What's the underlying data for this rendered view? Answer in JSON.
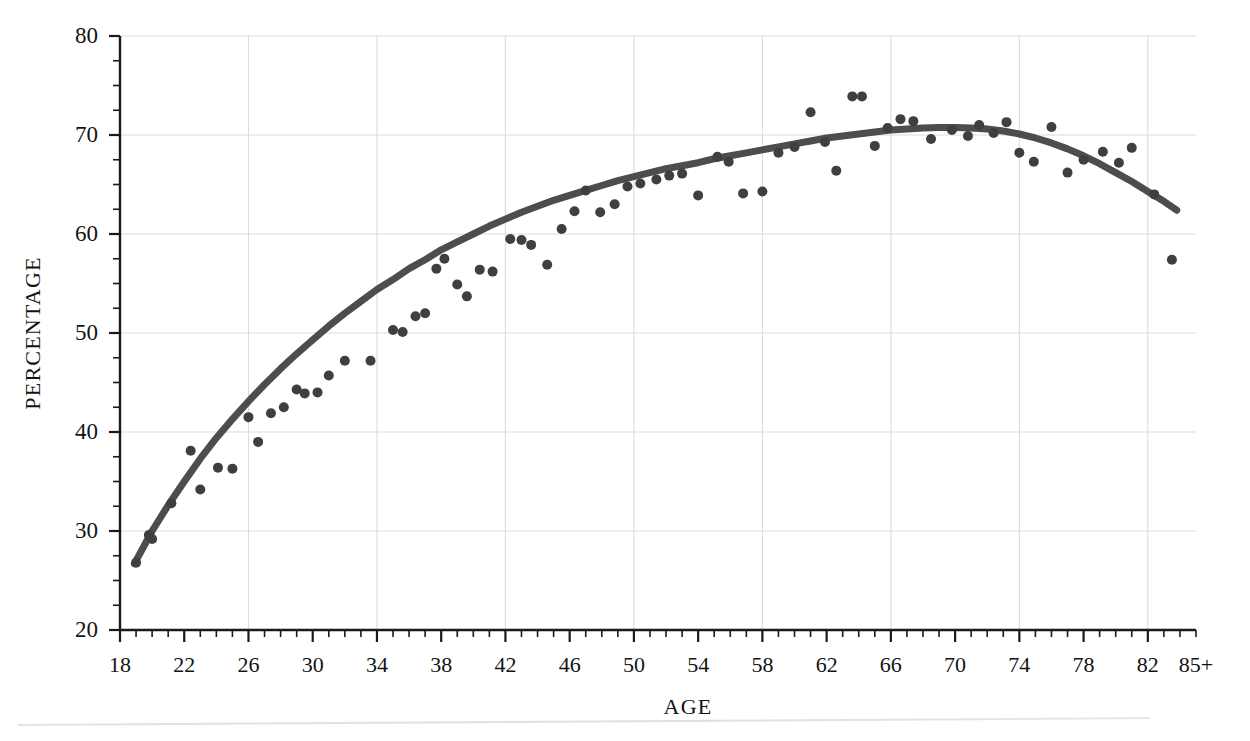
{
  "figure": {
    "top_cropped_text": "",
    "background_color": "#ffffff",
    "curve_color": "#4d4d4d",
    "point_color": "#3f3f3f",
    "grid_color": "#dcdcdc",
    "axis_color": "#1a1a1a"
  },
  "chart_data": {
    "type": "scatter",
    "title": "",
    "xlabel": "AGE",
    "ylabel": "PERCENTAGE",
    "xlim": [
      18,
      85
    ],
    "ylim": [
      20,
      80
    ],
    "grid": true,
    "legend": null,
    "x_major_step": 4,
    "x_minor_step": 1,
    "x_gridline_step": 8,
    "y_major_step": 10,
    "y_minor_step": 2.5,
    "x_tick_labels": [
      "18",
      "22",
      "26",
      "30",
      "34",
      "38",
      "42",
      "46",
      "50",
      "54",
      "58",
      "62",
      "66",
      "70",
      "74",
      "78",
      "82",
      "85+"
    ],
    "x_tick_values": [
      18,
      22,
      26,
      30,
      34,
      38,
      42,
      46,
      50,
      54,
      58,
      62,
      66,
      70,
      74,
      78,
      82,
      85
    ],
    "y_tick_labels": [
      "20",
      "30",
      "40",
      "50",
      "60",
      "70",
      "80"
    ],
    "y_tick_values": [
      20,
      30,
      40,
      50,
      60,
      70,
      80
    ],
    "x_gridline_values": [
      26,
      34,
      42,
      50,
      58,
      66,
      74,
      82
    ],
    "series": [
      {
        "name": "observed",
        "type": "scatter",
        "marker": "circle",
        "marker_size": 5,
        "color": "#3f3f3f",
        "points": [
          [
            19.0,
            26.8
          ],
          [
            19.8,
            29.6
          ],
          [
            20.0,
            29.2
          ],
          [
            21.2,
            32.8
          ],
          [
            22.4,
            38.1
          ],
          [
            23.0,
            34.2
          ],
          [
            24.1,
            36.4
          ],
          [
            25.0,
            36.3
          ],
          [
            26.0,
            41.5
          ],
          [
            26.6,
            39.0
          ],
          [
            27.4,
            41.9
          ],
          [
            28.2,
            42.5
          ],
          [
            29.0,
            44.3
          ],
          [
            29.5,
            43.9
          ],
          [
            30.3,
            44.0
          ],
          [
            31.0,
            45.7
          ],
          [
            32.0,
            47.2
          ],
          [
            33.6,
            47.2
          ],
          [
            35.0,
            50.3
          ],
          [
            35.6,
            50.1
          ],
          [
            36.4,
            51.7
          ],
          [
            37.0,
            52.0
          ],
          [
            37.7,
            56.5
          ],
          [
            38.2,
            57.5
          ],
          [
            39.0,
            54.9
          ],
          [
            39.6,
            53.7
          ],
          [
            40.4,
            56.4
          ],
          [
            41.2,
            56.2
          ],
          [
            42.3,
            59.5
          ],
          [
            43.0,
            59.4
          ],
          [
            43.6,
            58.9
          ],
          [
            44.6,
            56.9
          ],
          [
            45.5,
            60.5
          ],
          [
            46.3,
            62.3
          ],
          [
            47.0,
            64.4
          ],
          [
            47.9,
            62.2
          ],
          [
            48.8,
            63.0
          ],
          [
            49.6,
            64.8
          ],
          [
            50.4,
            65.1
          ],
          [
            51.4,
            65.5
          ],
          [
            52.2,
            65.9
          ],
          [
            53.0,
            66.1
          ],
          [
            54.0,
            63.9
          ],
          [
            55.2,
            67.8
          ],
          [
            55.9,
            67.3
          ],
          [
            56.8,
            64.1
          ],
          [
            58.0,
            64.3
          ],
          [
            59.0,
            68.2
          ],
          [
            60.0,
            68.8
          ],
          [
            61.0,
            72.3
          ],
          [
            61.9,
            69.3
          ],
          [
            62.6,
            66.4
          ],
          [
            63.6,
            73.9
          ],
          [
            64.2,
            73.9
          ],
          [
            65.0,
            68.9
          ],
          [
            65.8,
            70.7
          ],
          [
            66.6,
            71.6
          ],
          [
            67.4,
            71.4
          ],
          [
            68.5,
            69.6
          ],
          [
            69.8,
            70.5
          ],
          [
            70.8,
            69.9
          ],
          [
            71.5,
            71.0
          ],
          [
            72.4,
            70.2
          ],
          [
            73.2,
            71.3
          ],
          [
            74.0,
            68.2
          ],
          [
            74.9,
            67.3
          ],
          [
            76.0,
            70.8
          ],
          [
            77.0,
            66.2
          ],
          [
            78.0,
            67.5
          ],
          [
            79.2,
            68.3
          ],
          [
            80.2,
            67.2
          ],
          [
            81.0,
            68.7
          ],
          [
            82.4,
            64.0
          ],
          [
            83.5,
            57.4
          ]
        ]
      },
      {
        "name": "fitted-curve",
        "type": "line",
        "color": "#4d4d4d",
        "line_width": 7,
        "points": [
          [
            18.9,
            26.7
          ],
          [
            20.0,
            30.0
          ],
          [
            21.0,
            32.6
          ],
          [
            22.0,
            35.0
          ],
          [
            23.0,
            37.3
          ],
          [
            24.0,
            39.4
          ],
          [
            25.0,
            41.3
          ],
          [
            26.0,
            43.1
          ],
          [
            27.0,
            44.8
          ],
          [
            28.0,
            46.4
          ],
          [
            29.0,
            47.9
          ],
          [
            30.0,
            49.3
          ],
          [
            31.0,
            50.7
          ],
          [
            32.0,
            52.0
          ],
          [
            33.0,
            53.2
          ],
          [
            34.0,
            54.4
          ],
          [
            35.0,
            55.4
          ],
          [
            36.0,
            56.5
          ],
          [
            37.0,
            57.4
          ],
          [
            38.0,
            58.4
          ],
          [
            39.0,
            59.2
          ],
          [
            40.0,
            60.0
          ],
          [
            41.0,
            60.8
          ],
          [
            42.0,
            61.5
          ],
          [
            43.0,
            62.2
          ],
          [
            44.0,
            62.8
          ],
          [
            45.0,
            63.4
          ],
          [
            46.0,
            63.9
          ],
          [
            47.0,
            64.4
          ],
          [
            48.0,
            64.9
          ],
          [
            49.0,
            65.4
          ],
          [
            50.0,
            65.8
          ],
          [
            51.0,
            66.2
          ],
          [
            52.0,
            66.6
          ],
          [
            53.0,
            66.9
          ],
          [
            54.0,
            67.2
          ],
          [
            55.0,
            67.6
          ],
          [
            56.0,
            67.9
          ],
          [
            57.0,
            68.2
          ],
          [
            58.0,
            68.5
          ],
          [
            59.0,
            68.8
          ],
          [
            60.0,
            69.1
          ],
          [
            61.0,
            69.4
          ],
          [
            62.0,
            69.7
          ],
          [
            63.0,
            69.9
          ],
          [
            64.0,
            70.1
          ],
          [
            65.0,
            70.3
          ],
          [
            66.0,
            70.5
          ],
          [
            67.0,
            70.6
          ],
          [
            68.0,
            70.7
          ],
          [
            69.0,
            70.75
          ],
          [
            70.0,
            70.75
          ],
          [
            71.0,
            70.7
          ],
          [
            72.0,
            70.6
          ],
          [
            73.0,
            70.4
          ],
          [
            74.0,
            70.1
          ],
          [
            75.0,
            69.7
          ],
          [
            76.0,
            69.2
          ],
          [
            77.0,
            68.6
          ],
          [
            78.0,
            67.9
          ],
          [
            79.0,
            67.1
          ],
          [
            80.0,
            66.2
          ],
          [
            81.0,
            65.3
          ],
          [
            82.0,
            64.3
          ],
          [
            83.0,
            63.3
          ],
          [
            83.8,
            62.4
          ]
        ]
      }
    ]
  }
}
